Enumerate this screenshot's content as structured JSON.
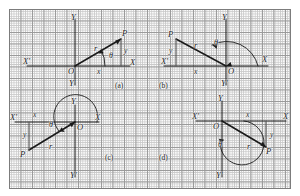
{
  "figure": {
    "background": "#ffffff",
    "grid_color": "#c9c9c9",
    "grid_major_color": "#9a9a9a",
    "ink_color": "#1a1a1a"
  },
  "panels": [
    {
      "id": "a",
      "caption": "(a)",
      "quadrant": 1,
      "axis_labels": {
        "x_pos": "X",
        "x_neg": "X'",
        "y_pos": "Y",
        "y_neg": "Y'"
      },
      "origin_label": "O",
      "point_label": "P",
      "leg_x_label": "x",
      "leg_y_label": "y",
      "radius_label": "r",
      "angle_label": "θ"
    },
    {
      "id": "b",
      "caption": "(b)",
      "quadrant": 2,
      "axis_labels": {
        "x_pos": "X",
        "x_neg": "X'",
        "y_pos": "Y",
        "y_neg": "Y'"
      },
      "origin_label": "O",
      "point_label": "P",
      "leg_x_label": "x",
      "leg_y_label": "y",
      "radius_label": "r",
      "angle_label": "θ"
    },
    {
      "id": "c",
      "caption": "(c)",
      "quadrant": 3,
      "axis_labels": {
        "x_pos": "X",
        "x_neg": "X'",
        "y_pos": "Y",
        "y_neg": "Y'"
      },
      "origin_label": "O",
      "point_label": "P",
      "leg_x_label": "x",
      "leg_y_label": "y",
      "radius_label": "r",
      "angle_label": "θ"
    },
    {
      "id": "d",
      "caption": "(d)",
      "quadrant": 4,
      "axis_labels": {
        "x_pos": "X",
        "x_neg": "X'",
        "y_pos": "Y",
        "y_neg": "Y'"
      },
      "origin_label": "O",
      "point_label": "P",
      "leg_x_label": "x",
      "leg_y_label": "y",
      "radius_label": "r",
      "angle_label": "θ"
    }
  ]
}
